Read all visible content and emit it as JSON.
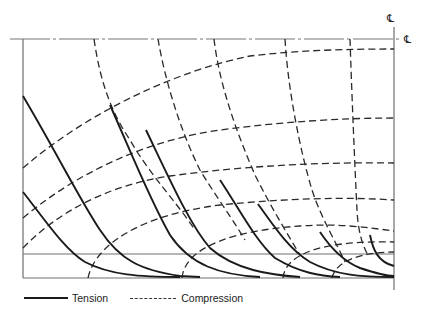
{
  "diagram": {
    "type": "stress-trajectory diagram",
    "centerline_symbol_top": "℄",
    "centerline_symbol_right": "℄",
    "colors": {
      "tension": "#1a1a1a",
      "compression": "#2a2a2a",
      "frame": "#6e6e6e"
    }
  },
  "legend": {
    "items": [
      {
        "style": "solid",
        "label": "Tension"
      },
      {
        "style": "dashed",
        "label": "Compression"
      }
    ]
  }
}
